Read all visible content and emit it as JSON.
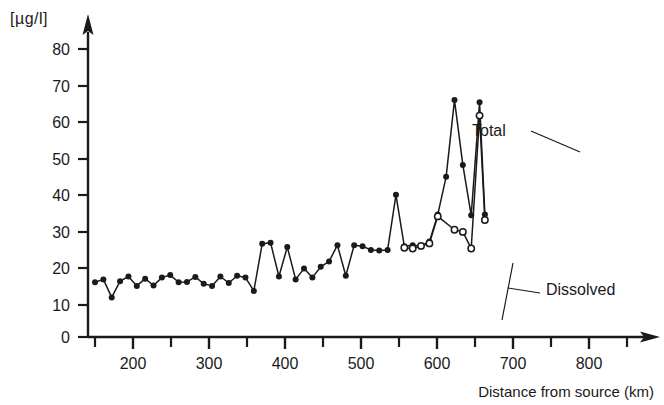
{
  "chart_data": {
    "type": "line",
    "title": "",
    "subtitle": "",
    "xlabel": "Distance from source (km)",
    "ylabel": "[µg/l]",
    "xlim": [
      140,
      870
    ],
    "ylim": [
      0,
      85
    ],
    "grid": false,
    "legend_position": "inline-annotations",
    "x_ticks_major": [
      200,
      300,
      400,
      500,
      600,
      700,
      800
    ],
    "x_ticks_minor": [
      150,
      250,
      350,
      450,
      550,
      650,
      750,
      850
    ],
    "x_tick_labels": [
      "200",
      "300",
      "400",
      "500",
      "600",
      "700",
      "800"
    ],
    "y_ticks": [
      0,
      10,
      20,
      30,
      40,
      50,
      60,
      70,
      80
    ],
    "y_tick_labels": [
      "0",
      "10",
      "20",
      "30",
      "40",
      "50",
      "60",
      "70",
      "80"
    ],
    "annotations": [
      {
        "text": "Total",
        "x": 700,
        "y": 61
      },
      {
        "text": "Dissolved",
        "x": 775,
        "y": 13
      }
    ],
    "series": [
      {
        "name": "Total",
        "marker": "filled-circle",
        "color": "#1a1a1a",
        "points": [
          [
            150,
            15.2
          ],
          [
            161,
            16.0
          ],
          [
            172,
            11.0
          ],
          [
            183,
            15.5
          ],
          [
            194,
            16.8
          ],
          [
            205,
            14.2
          ],
          [
            216,
            16.2
          ],
          [
            227,
            14.3
          ],
          [
            238,
            16.5
          ],
          [
            249,
            17.2
          ],
          [
            260,
            15.2
          ],
          [
            271,
            15.3
          ],
          [
            282,
            16.7
          ],
          [
            293,
            14.8
          ],
          [
            304,
            14.2
          ],
          [
            315,
            16.8
          ],
          [
            326,
            15.0
          ],
          [
            337,
            17.0
          ],
          [
            348,
            16.5
          ],
          [
            359,
            12.8
          ],
          [
            370,
            25.9
          ],
          [
            381,
            26.2
          ],
          [
            392,
            16.8
          ],
          [
            403,
            25.0
          ],
          [
            414,
            16.0
          ],
          [
            425,
            19.0
          ],
          [
            436,
            16.5
          ],
          [
            447,
            19.5
          ],
          [
            458,
            21.0
          ],
          [
            469,
            25.5
          ],
          [
            480,
            17.0
          ],
          [
            491,
            25.5
          ],
          [
            502,
            25.2
          ],
          [
            513,
            24.2
          ],
          [
            524,
            24.0
          ],
          [
            535,
            24.2
          ],
          [
            546,
            39.5
          ],
          [
            557,
            25.2
          ],
          [
            568,
            25.5
          ],
          [
            579,
            25.3
          ],
          [
            590,
            26.5
          ],
          [
            601,
            34.0
          ],
          [
            612,
            44.5
          ],
          [
            623,
            65.8
          ],
          [
            634,
            47.8
          ],
          [
            645,
            33.8
          ],
          [
            656,
            65.2
          ],
          [
            663,
            34.0
          ]
        ]
      },
      {
        "name": "Dissolved",
        "marker": "open-circle",
        "color": "#1a1a1a",
        "points": [
          [
            557,
            24.8
          ],
          [
            568,
            24.6
          ],
          [
            579,
            25.3
          ],
          [
            590,
            26.0
          ],
          [
            601,
            33.5
          ],
          [
            623,
            29.8
          ],
          [
            634,
            29.2
          ],
          [
            645,
            24.6
          ],
          [
            656,
            61.5
          ],
          [
            663,
            32.5
          ]
        ]
      }
    ]
  },
  "axes": {
    "y_unit": "[µg/l]",
    "x_title": "Distance from source (km)"
  }
}
